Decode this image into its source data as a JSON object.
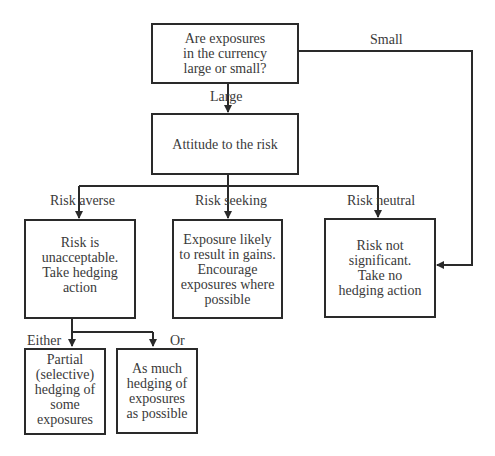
{
  "diagram": {
    "nodes": {
      "question": "Are exposures\nin the currency\nlarge or small?",
      "attitude": "Attitude to the risk",
      "averse": "Risk is\nunacceptable.\nTake hedging\naction",
      "seeking": "Exposure likely\nto result in gains.\nEncourage\nexposures where\npossible",
      "neutral": "Risk not\nsignificant.\nTake no\nhedging action",
      "partial": "Partial\n(selective)\nhedging of\nsome\nexposures",
      "full": "As much\nhedging of\nexposures\nas possible"
    },
    "edge_labels": {
      "large": "Large",
      "small": "Small",
      "risk_averse": "Risk averse",
      "risk_seeking": "Risk seeking",
      "risk_neutral": "Risk neutral",
      "either": "Either",
      "or": "Or"
    },
    "colors": {
      "line": "#2a2a2a",
      "text": "#3a3a3a",
      "background": "#ffffff"
    }
  }
}
